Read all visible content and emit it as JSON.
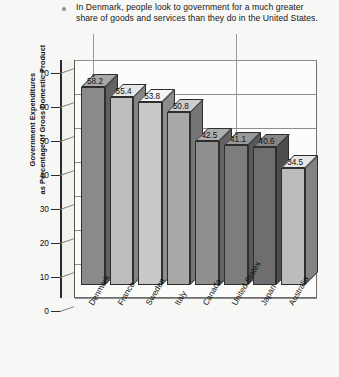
{
  "callout": {
    "bullet_icon": "bullet-dot",
    "text": "In Denmark, people look to government for a much greater share of goods and services than they do in the United States."
  },
  "axis": {
    "y_title_line1": "Government Expenditures",
    "y_title_line2": "as Percentage of Gross Domestic Product",
    "y_ticks": [
      "70",
      "60",
      "50",
      "40",
      "30",
      "20",
      "10",
      "0"
    ]
  },
  "chart_data": {
    "type": "bar",
    "title": "",
    "subtitle": "",
    "xlabel": "",
    "ylabel": "Government Expenditures as Percentage of Gross Domestic Product",
    "ylim": [
      0,
      70
    ],
    "ytick_step": 10,
    "grid": true,
    "legend": "none",
    "style": "3d-column",
    "categories": [
      "Denmark",
      "France",
      "Sweden",
      "Italy",
      "Canada",
      "United States",
      "Japan",
      "Australia"
    ],
    "values": [
      58.2,
      55.4,
      53.8,
      50.8,
      42.5,
      41.1,
      40.6,
      34.5
    ],
    "value_labels": [
      "58.2",
      "55.4",
      "53.8",
      "50.8",
      "42.5",
      "41.1",
      "40.6",
      "34.5"
    ],
    "annotations": [
      {
        "target": "Denmark",
        "note": "callout leader line"
      },
      {
        "target": "United States",
        "note": "callout leader line"
      }
    ],
    "bar_colors": [
      "#8a8a8a",
      "#bdbdbd",
      "#c9c9c9",
      "#a8a8a8",
      "#8f8f8f",
      "#7d7d7d",
      "#6e6e6e",
      "#bcbcbc"
    ]
  },
  "colors": {
    "background": "#f7f7f5",
    "plot_background": "#fcfcfa",
    "axis": "#2a2a2a",
    "grid": "#8d8d8d",
    "text": "#101010"
  }
}
